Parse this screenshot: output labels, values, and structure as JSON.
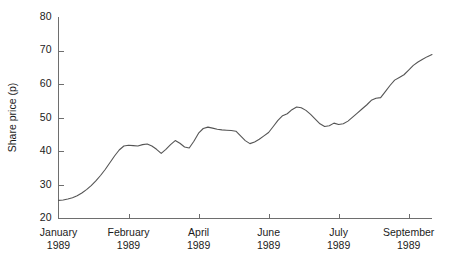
{
  "chart_data": {
    "type": "line",
    "title": "",
    "subtitle": "",
    "xlabel": "",
    "ylabel": "Share price (p)",
    "ylim": [
      20,
      80
    ],
    "yticks": [
      20,
      30,
      40,
      50,
      60,
      70,
      80
    ],
    "ytick_labels": [
      "20",
      "30",
      "40",
      "50",
      "60",
      "70",
      "80"
    ],
    "grid": false,
    "legend": null,
    "legend_position": "none",
    "xtick_labels": [
      "January\n1989",
      "February\n1989",
      "April\n1989",
      "June\n1989",
      "July\n1989",
      "September\n1989"
    ],
    "xticks": [
      {
        "line1": "January",
        "line2": "1989",
        "position": 0
      },
      {
        "line1": "February",
        "line2": "1989",
        "position": 15
      },
      {
        "line1": "April",
        "line2": "1989",
        "position": 30
      },
      {
        "line1": "June",
        "line2": "1989",
        "position": 45
      },
      {
        "line1": "July",
        "line2": "1989",
        "position": 60
      },
      {
        "line1": "September",
        "line2": "1989",
        "position": 75
      }
    ],
    "xlim": [
      0,
      80
    ],
    "series": [
      {
        "name": "Share price",
        "color": "#555555",
        "x": [
          0,
          1,
          2,
          3,
          4,
          5,
          6,
          7,
          8,
          9,
          10,
          11,
          12,
          13,
          14,
          15,
          16,
          17,
          18,
          19,
          20,
          21,
          22,
          23,
          24,
          25,
          26,
          27,
          28,
          29,
          30,
          31,
          32,
          33,
          34,
          35,
          36,
          37,
          38,
          39,
          40,
          41,
          42,
          43,
          44,
          45,
          46,
          47,
          48,
          49,
          50,
          51,
          52,
          53,
          54,
          55,
          56,
          57,
          58,
          59,
          60,
          61,
          62,
          63,
          64,
          65,
          66,
          67,
          68,
          69,
          70,
          71,
          72,
          73,
          74,
          75,
          76,
          77,
          78,
          79,
          80
        ],
        "values": [
          25.4,
          25.5,
          25.8,
          26.2,
          26.8,
          27.6,
          28.6,
          29.8,
          31.2,
          32.8,
          34.6,
          36.6,
          38.6,
          40.4,
          41.6,
          41.8,
          41.7,
          41.6,
          42.0,
          42.2,
          41.6,
          40.6,
          39.4,
          40.6,
          42.0,
          43.2,
          42.4,
          41.3,
          41.0,
          43.0,
          45.4,
          46.8,
          47.2,
          46.9,
          46.6,
          46.4,
          46.3,
          46.2,
          46.0,
          44.6,
          43.2,
          42.3,
          42.8,
          43.6,
          44.6,
          45.6,
          47.4,
          49.2,
          50.6,
          51.2,
          52.4,
          53.2,
          53.0,
          52.2,
          51.0,
          49.6,
          48.2,
          47.4,
          47.6,
          48.4,
          48.0,
          48.2,
          49.0,
          50.2,
          51.4,
          52.6,
          53.8,
          55.2,
          55.8,
          56.0,
          57.8,
          59.6,
          61.2,
          62.0,
          62.8,
          64.2,
          65.6,
          66.6,
          67.4,
          68.2,
          68.8
        ]
      }
    ]
  },
  "axis": {
    "y_label": "Share price (p)"
  }
}
